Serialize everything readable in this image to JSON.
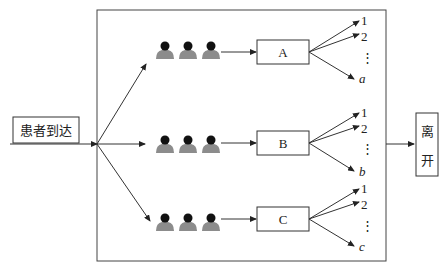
{
  "diagram": {
    "type": "queueing-flow",
    "entry": {
      "label": "患者到达"
    },
    "exit": {
      "label_top": "离",
      "label_bottom": "开"
    },
    "servers": [
      {
        "label": "A",
        "outputs": [
          "1",
          "2",
          "⋮",
          "a"
        ]
      },
      {
        "label": "B",
        "outputs": [
          "1",
          "2",
          "⋮",
          "b"
        ]
      },
      {
        "label": "C",
        "outputs": [
          "1",
          "2",
          "⋮",
          "c"
        ]
      }
    ],
    "queue_icon": "person-icon",
    "queue_length_shown": 3,
    "colors": {
      "line": "#333333",
      "person_head": "#111111",
      "person_body": "#8c8c8c"
    }
  }
}
